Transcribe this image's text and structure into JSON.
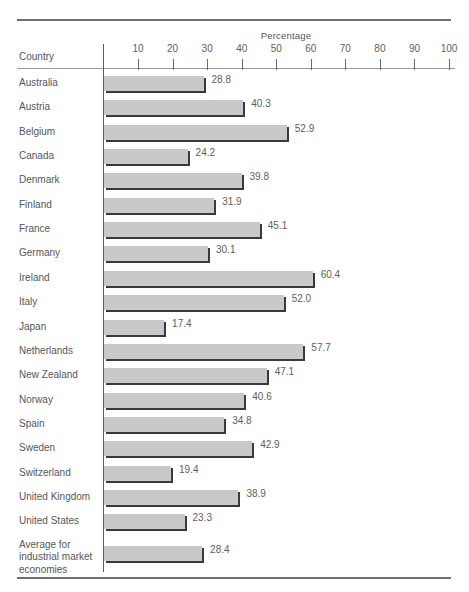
{
  "chart_data": {
    "type": "bar",
    "orientation": "horizontal",
    "title": "",
    "xlabel": "Percentage",
    "ylabel": "Country",
    "xlim": [
      0,
      100
    ],
    "grid": false,
    "legend": null,
    "xticks": [
      10,
      20,
      30,
      40,
      50,
      60,
      70,
      80,
      90,
      100
    ],
    "xtick_labels": [
      "10",
      "20",
      "30",
      "40",
      "50",
      "60",
      "70",
      "80",
      "90",
      "100"
    ],
    "categories": [
      "Australia",
      "Austria",
      "Belgium",
      "Canada",
      "Denmark",
      "Finland",
      "France",
      "Germany",
      "Ireland",
      "Italy",
      "Japan",
      "Netherlands",
      "New Zealand",
      "Norway",
      "Spain",
      "Sweden",
      "Switzerland",
      "United Kingdom",
      "United States",
      "Average for industrial market economies"
    ],
    "values": [
      28.8,
      40.3,
      52.9,
      24.2,
      39.8,
      31.9,
      45.1,
      30.1,
      60.4,
      52.0,
      17.4,
      57.7,
      47.1,
      40.6,
      34.8,
      42.9,
      19.4,
      38.9,
      23.3,
      28.4
    ],
    "value_labels": [
      "28.8",
      "40.3",
      "52.9",
      "24.2",
      "39.8",
      "31.9",
      "45.1",
      "30.1",
      "60.4",
      "52.0",
      "17.4",
      "57.7",
      "47.1",
      "40.6",
      "34.8",
      "42.9",
      "19.4",
      "38.9",
      "23.3",
      "28.4"
    ],
    "colors": {
      "bar_fill": "#c9c9c9",
      "bar_shadow": "#3a3a3a",
      "text": "#55565a",
      "rule": "#6e6e6e",
      "axis": "#5d5d5d"
    }
  },
  "rows": [
    {
      "label": "Australia",
      "value": 28.8,
      "value_label": "28.8"
    },
    {
      "label": "Austria",
      "value": 40.3,
      "value_label": "40.3"
    },
    {
      "label": "Belgium",
      "value": 52.9,
      "value_label": "52.9"
    },
    {
      "label": "Canada",
      "value": 24.2,
      "value_label": "24.2"
    },
    {
      "label": "Denmark",
      "value": 39.8,
      "value_label": "39.8"
    },
    {
      "label": "Finland",
      "value": 31.9,
      "value_label": "31.9"
    },
    {
      "label": "France",
      "value": 45.1,
      "value_label": "45.1"
    },
    {
      "label": "Germany",
      "value": 30.1,
      "value_label": "30.1"
    },
    {
      "label": "Ireland",
      "value": 60.4,
      "value_label": "60.4"
    },
    {
      "label": "Italy",
      "value": 52.0,
      "value_label": "52.0"
    },
    {
      "label": "Japan",
      "value": 17.4,
      "value_label": "17.4"
    },
    {
      "label": "Netherlands",
      "value": 57.7,
      "value_label": "57.7"
    },
    {
      "label": "New Zealand",
      "value": 47.1,
      "value_label": "47.1"
    },
    {
      "label": "Norway",
      "value": 40.6,
      "value_label": "40.6"
    },
    {
      "label": "Spain",
      "value": 34.8,
      "value_label": "34.8"
    },
    {
      "label": "Sweden",
      "value": 42.9,
      "value_label": "42.9"
    },
    {
      "label": "Switzerland",
      "value": 19.4,
      "value_label": "19.4"
    },
    {
      "label": "United Kingdom",
      "value": 38.9,
      "value_label": "38.9"
    },
    {
      "label": "United States",
      "value": 23.3,
      "value_label": "23.3"
    },
    {
      "label": "Average for industrial market economies",
      "value": 28.4,
      "value_label": "28.4",
      "multiline": true
    }
  ],
  "header": {
    "country_label": "Country",
    "percentage_label": "Percentage"
  }
}
